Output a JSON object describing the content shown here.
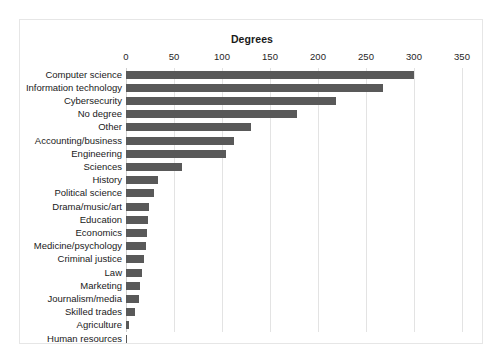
{
  "chart_data": {
    "type": "bar",
    "orientation": "horizontal",
    "title": "Degrees",
    "xlabel": "",
    "ylabel": "",
    "xlim": [
      0,
      350
    ],
    "xticks": [
      0,
      50,
      100,
      150,
      200,
      250,
      300,
      350
    ],
    "grid": true,
    "legend": false,
    "bar_color": "#595959",
    "categories": [
      "Computer science",
      "Information technology",
      "Cybersecurity",
      "No degree",
      "Other",
      "Accounting/business",
      "Engineering",
      "Sciences",
      "History",
      "Political science",
      "Drama/music/art",
      "Education",
      "Economics",
      "Medicine/psychology",
      "Criminal justice",
      "Law",
      "Marketing",
      "Journalism/media",
      "Skilled trades",
      "Agriculture",
      "Human resources"
    ],
    "values": [
      300,
      268,
      219,
      178,
      130,
      112,
      104,
      58,
      33,
      29,
      24,
      23,
      22,
      21,
      19,
      17,
      15,
      14,
      9,
      3,
      0
    ]
  }
}
